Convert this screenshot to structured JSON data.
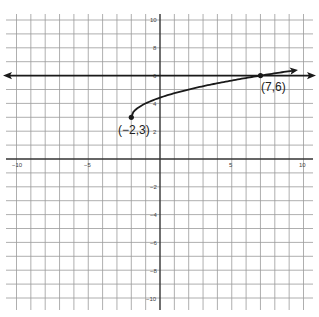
{
  "chart_data": {
    "type": "line",
    "title": "",
    "xlabel": "",
    "ylabel": "",
    "xlim": [
      -10,
      10
    ],
    "ylim": [
      -10,
      10
    ],
    "grid": true,
    "x_tick_labels": [
      "-10",
      "-5",
      "5",
      "10"
    ],
    "y_tick_labels": [
      "10",
      "8",
      "6",
      "4",
      "2",
      "-2",
      "-4",
      "-6",
      "-8",
      "-10"
    ],
    "series": [
      {
        "name": "horizontal line y = 6",
        "kind": "line",
        "equation": "y = 6",
        "arrows": "both",
        "x": [
          -10.7,
          10.7
        ],
        "y": [
          6,
          6
        ]
      },
      {
        "name": "square-root curve",
        "kind": "curve",
        "equation": "y = sqrt(x + 2) + 3",
        "start_point": [
          -2,
          3
        ],
        "arrows": "end",
        "x": [
          -2,
          -1,
          0,
          2,
          4,
          7,
          9.4
        ],
        "y": [
          3,
          4,
          4.41,
          5,
          5.45,
          6,
          6.38
        ]
      }
    ],
    "points": [
      {
        "label": "(−2,3)",
        "x": -2,
        "y": 3
      },
      {
        "label": "(7,6)",
        "x": 7,
        "y": 6
      }
    ],
    "annotations": [
      "(−2,3)",
      "(7,6)"
    ]
  },
  "labels": {
    "point_a": "(−2,3)",
    "point_b": "(7,6)",
    "x_ticks": {
      "m10": "−10",
      "m5": "−5",
      "p5": "5",
      "p10": "10"
    },
    "y_ticks": {
      "p10": "10",
      "p8": "8",
      "p6": "6",
      "p4": "4",
      "p2": "2",
      "m2": "−2",
      "m4": "−4",
      "m6": "−6",
      "m8": "−8",
      "m10": "−10"
    }
  }
}
